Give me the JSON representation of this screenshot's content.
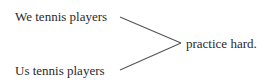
{
  "diagram": {
    "subjects": [
      "We tennis players",
      "Us tennis players"
    ],
    "predicate": "practice hard.",
    "line_color": "#555555"
  }
}
